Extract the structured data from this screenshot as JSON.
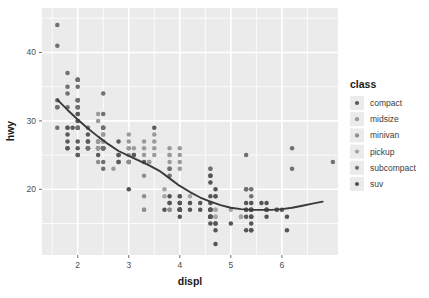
{
  "chart_data": {
    "type": "scatter",
    "title": "",
    "subtitle": "",
    "xlabel": "displ",
    "ylabel": "hwy",
    "xlim": [
      1.3,
      7.1
    ],
    "ylim": [
      10.4,
      46.5
    ],
    "xticks": [
      2,
      3,
      4,
      5,
      6
    ],
    "xticklabels": [
      "2",
      "3",
      "4",
      "5",
      "6"
    ],
    "yticks": [
      20,
      30,
      40
    ],
    "yticklabels": [
      "20",
      "30",
      "40"
    ],
    "grid": true,
    "grid_color": "#ffffff",
    "panel_background": "#ebebeb",
    "plot_background": "#ffffff",
    "point_color": "#6b6b6b",
    "point_size": 3.4,
    "legend": {
      "title": "class",
      "position": "right",
      "entries": [
        {
          "label": "compact",
          "color": "#5a5a5a"
        },
        {
          "label": "midsize",
          "color": "#9a9a9a"
        },
        {
          "label": "minivan",
          "color": "#8f8f8f"
        },
        {
          "label": "pickup",
          "color": "#a5a5a5"
        },
        {
          "label": "subcompact",
          "color": "#707070"
        },
        {
          "label": "suv",
          "color": "#555555"
        }
      ],
      "key_background": "#ebebeb"
    },
    "smooth": {
      "method": "loess",
      "line_color": "#3a3a3a",
      "line_width": 1.9,
      "points": [
        [
          1.6,
          33.1
        ],
        [
          1.8,
          31.6
        ],
        [
          2.0,
          30.2
        ],
        [
          2.2,
          28.9
        ],
        [
          2.4,
          27.7
        ],
        [
          2.6,
          26.6
        ],
        [
          2.8,
          25.6
        ],
        [
          3.0,
          24.9
        ],
        [
          3.2,
          24.2
        ],
        [
          3.4,
          23.5
        ],
        [
          3.6,
          22.7
        ],
        [
          3.8,
          21.6
        ],
        [
          4.0,
          20.5
        ],
        [
          4.2,
          19.6
        ],
        [
          4.4,
          18.8
        ],
        [
          4.6,
          18.2
        ],
        [
          4.8,
          17.7
        ],
        [
          5.0,
          17.3
        ],
        [
          5.2,
          17.1
        ],
        [
          5.4,
          17.0
        ],
        [
          5.6,
          17.0
        ],
        [
          5.8,
          17.0
        ],
        [
          6.0,
          17.1
        ],
        [
          6.2,
          17.3
        ],
        [
          6.4,
          17.6
        ],
        [
          6.6,
          17.9
        ],
        [
          6.8,
          18.2
        ]
      ]
    },
    "series": [
      {
        "name": "compact",
        "color": "#5a5a5a",
        "points": [
          [
            1.8,
            29
          ],
          [
            1.8,
            29
          ],
          [
            2.0,
            31
          ],
          [
            2.0,
            30
          ],
          [
            1.8,
            26
          ],
          [
            1.8,
            26
          ],
          [
            2.0,
            27
          ],
          [
            2.0,
            26
          ],
          [
            2.8,
            25
          ],
          [
            2.8,
            24
          ],
          [
            3.1,
            25
          ],
          [
            1.8,
            28
          ],
          [
            1.8,
            27
          ],
          [
            2.0,
            25
          ],
          [
            2.0,
            25
          ],
          [
            2.8,
            25
          ],
          [
            2.8,
            24
          ],
          [
            3.1,
            25
          ],
          [
            2.4,
            27
          ],
          [
            2.4,
            26
          ],
          [
            2.5,
            26
          ],
          [
            2.5,
            26
          ],
          [
            3.3,
            24
          ],
          [
            2.0,
            31
          ],
          [
            2.0,
            30
          ],
          [
            2.0,
            33
          ],
          [
            2.0,
            32
          ],
          [
            2.8,
            27
          ],
          [
            1.9,
            29
          ],
          [
            2.0,
            29
          ],
          [
            2.0,
            29
          ],
          [
            2.5,
            26
          ],
          [
            2.5,
            26
          ],
          [
            2.2,
            26
          ],
          [
            2.2,
            27
          ],
          [
            2.4,
            26
          ],
          [
            2.4,
            25
          ],
          [
            3.0,
            24
          ],
          [
            3.0,
            24
          ],
          [
            3.5,
            29
          ],
          [
            2.2,
            28
          ],
          [
            2.2,
            27
          ]
        ]
      },
      {
        "name": "midsize",
        "color": "#9a9a9a",
        "points": [
          [
            2.4,
            27
          ],
          [
            2.4,
            26
          ],
          [
            3.1,
            26
          ],
          [
            3.5,
            25
          ],
          [
            2.4,
            27
          ],
          [
            2.4,
            26
          ],
          [
            3.0,
            26
          ],
          [
            3.5,
            26
          ],
          [
            3.3,
            27
          ],
          [
            3.8,
            25
          ],
          [
            3.8,
            24
          ],
          [
            4.0,
            23
          ],
          [
            2.4,
            31
          ],
          [
            2.4,
            30
          ],
          [
            3.0,
            28
          ],
          [
            3.0,
            27
          ],
          [
            3.5,
            28
          ],
          [
            3.5,
            27
          ],
          [
            2.5,
            29
          ],
          [
            2.5,
            29
          ],
          [
            2.5,
            28
          ],
          [
            2.5,
            27
          ],
          [
            2.5,
            26
          ],
          [
            3.0,
            26
          ],
          [
            3.0,
            25
          ],
          [
            3.3,
            26
          ],
          [
            3.3,
            25
          ],
          [
            3.8,
            26
          ],
          [
            3.8,
            25
          ],
          [
            4.0,
            26
          ],
          [
            2.7,
            23
          ],
          [
            3.4,
            24
          ],
          [
            3.4,
            24
          ],
          [
            4.0,
            25
          ],
          [
            4.0,
            24
          ],
          [
            4.6,
            23
          ],
          [
            4.6,
            22
          ],
          [
            2.5,
            28
          ],
          [
            2.5,
            27
          ]
        ]
      },
      {
        "name": "minivan",
        "color": "#8f8f8f",
        "points": [
          [
            2.4,
            24
          ],
          [
            3.0,
            24
          ],
          [
            3.3,
            22
          ],
          [
            3.8,
            18
          ],
          [
            3.8,
            18
          ],
          [
            3.3,
            17
          ],
          [
            3.3,
            17
          ],
          [
            3.8,
            17
          ],
          [
            3.8,
            17
          ],
          [
            4.0,
            17
          ],
          [
            3.3,
            19
          ]
        ]
      },
      {
        "name": "pickup",
        "color": "#a5a5a5",
        "points": [
          [
            3.7,
            20
          ],
          [
            3.7,
            19
          ],
          [
            4.0,
            18
          ],
          [
            4.0,
            17
          ],
          [
            4.7,
            19
          ],
          [
            4.7,
            19
          ],
          [
            4.7,
            17
          ],
          [
            5.7,
            17
          ],
          [
            5.7,
            17
          ],
          [
            5.2,
            16
          ],
          [
            5.2,
            16
          ],
          [
            4.7,
            17
          ],
          [
            4.7,
            16
          ],
          [
            4.7,
            16
          ],
          [
            5.2,
            16
          ],
          [
            5.7,
            17
          ],
          [
            5.9,
            17
          ],
          [
            4.6,
            18
          ],
          [
            5.4,
            18
          ],
          [
            5.4,
            17
          ],
          [
            4.0,
            19
          ],
          [
            4.0,
            18
          ],
          [
            4.6,
            17
          ],
          [
            5.0,
            17
          ],
          [
            4.2,
            19
          ],
          [
            4.2,
            18
          ],
          [
            4.6,
            17
          ],
          [
            4.6,
            17
          ],
          [
            4.6,
            16
          ],
          [
            5.4,
            16
          ],
          [
            5.4,
            16
          ],
          [
            4.0,
            18
          ],
          [
            4.0,
            17
          ]
        ]
      },
      {
        "name": "subcompact",
        "color": "#707070",
        "points": [
          [
            2.0,
            33
          ],
          [
            2.0,
            32
          ],
          [
            2.0,
            29
          ],
          [
            2.0,
            32
          ],
          [
            2.5,
            31
          ],
          [
            2.5,
            29
          ],
          [
            2.2,
            26
          ],
          [
            2.2,
            26
          ],
          [
            2.5,
            26
          ],
          [
            2.5,
            26
          ],
          [
            2.5,
            29
          ],
          [
            2.5,
            24
          ],
          [
            3.8,
            23
          ],
          [
            3.8,
            22
          ],
          [
            4.6,
            23
          ],
          [
            4.6,
            22
          ],
          [
            5.4,
            20
          ],
          [
            5.4,
            19
          ],
          [
            1.6,
            33
          ],
          [
            1.6,
            32
          ],
          [
            1.6,
            32
          ],
          [
            1.6,
            29
          ],
          [
            1.8,
            32
          ],
          [
            1.8,
            34
          ],
          [
            2.0,
            36
          ],
          [
            2.0,
            36
          ],
          [
            2.2,
            29
          ],
          [
            2.2,
            26
          ],
          [
            1.6,
            44
          ],
          [
            1.6,
            41
          ],
          [
            1.8,
            37
          ],
          [
            1.8,
            35
          ],
          [
            2.0,
            36
          ],
          [
            2.0,
            36
          ],
          [
            2.0,
            33
          ],
          [
            2.0,
            35
          ],
          [
            2.5,
            34
          ],
          [
            2.5,
            26
          ],
          [
            2.5,
            23
          ],
          [
            3.8,
            23
          ],
          [
            5.3,
            25
          ],
          [
            5.3,
            20
          ],
          [
            5.7,
            17
          ],
          [
            6.2,
            26
          ],
          [
            6.2,
            23
          ],
          [
            7.0,
            24
          ],
          [
            5.3,
            20
          ],
          [
            5.3,
            17
          ]
        ]
      },
      {
        "name": "suv",
        "color": "#555555",
        "points": [
          [
            4.0,
            17
          ],
          [
            4.0,
            17
          ],
          [
            4.6,
            16
          ],
          [
            5.0,
            15
          ],
          [
            4.2,
            17
          ],
          [
            4.4,
            17
          ],
          [
            4.6,
            16
          ],
          [
            5.4,
            14
          ],
          [
            5.4,
            15
          ],
          [
            4.0,
            17
          ],
          [
            4.0,
            16
          ],
          [
            4.6,
            15
          ],
          [
            4.6,
            16
          ],
          [
            5.4,
            14
          ],
          [
            3.8,
            19
          ],
          [
            3.8,
            18
          ],
          [
            4.0,
            17
          ],
          [
            4.0,
            17
          ],
          [
            4.6,
            17
          ],
          [
            4.6,
            16
          ],
          [
            4.7,
            15
          ],
          [
            5.7,
            17
          ],
          [
            6.1,
            14
          ],
          [
            4.0,
            18
          ],
          [
            4.2,
            18
          ],
          [
            4.4,
            18
          ],
          [
            4.6,
            17
          ],
          [
            5.4,
            16
          ],
          [
            5.4,
            17
          ],
          [
            4.0,
            17
          ],
          [
            4.7,
            12
          ],
          [
            4.7,
            15
          ],
          [
            4.7,
            14
          ],
          [
            5.7,
            16
          ],
          [
            6.1,
            16
          ],
          [
            4.0,
            19
          ],
          [
            4.0,
            18
          ],
          [
            4.6,
            17
          ],
          [
            5.4,
            16
          ],
          [
            5.3,
            18
          ],
          [
            5.3,
            17
          ],
          [
            5.3,
            16
          ],
          [
            5.7,
            18
          ],
          [
            6.0,
            17
          ],
          [
            5.6,
            18
          ],
          [
            3.0,
            20
          ],
          [
            3.7,
            17
          ],
          [
            4.0,
            17
          ],
          [
            4.7,
            20
          ],
          [
            4.7,
            19
          ],
          [
            5.9,
            17
          ],
          [
            4.6,
            22
          ],
          [
            4.6,
            21
          ],
          [
            5.4,
            17
          ],
          [
            5.4,
            17
          ],
          [
            4.6,
            19
          ],
          [
            4.6,
            18
          ],
          [
            5.4,
            18
          ],
          [
            5.3,
            14
          ]
        ]
      }
    ]
  },
  "axis": {
    "x_title": "displ",
    "y_title": "hwy",
    "x_tick_labels": [
      "2",
      "3",
      "4",
      "5",
      "6"
    ],
    "y_tick_labels": [
      "20",
      "30",
      "40"
    ]
  },
  "legend": {
    "title": "class",
    "items": [
      {
        "label": "compact"
      },
      {
        "label": "midsize"
      },
      {
        "label": "minivan"
      },
      {
        "label": "pickup"
      },
      {
        "label": "subcompact"
      },
      {
        "label": "suv"
      }
    ]
  }
}
